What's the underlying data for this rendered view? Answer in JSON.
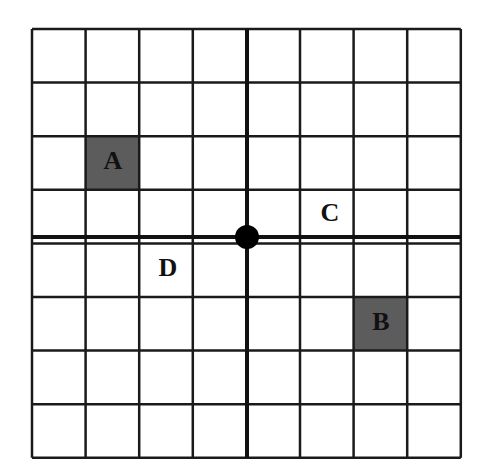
{
  "grid": {
    "rows": 8,
    "cols": 8,
    "left": 32,
    "top": 29,
    "cell": 53.6,
    "line_color": "#1a1a1a",
    "axis_color": "#111111",
    "background": "#ffffff"
  },
  "origin": {
    "x": 247,
    "y": 237,
    "radius": 12,
    "color": "#000000"
  },
  "shaded_cells": [
    {
      "label": "A",
      "col": 1,
      "row": 2,
      "fill": "#5c5c5c"
    },
    {
      "label": "B",
      "col": 6,
      "row": 5,
      "fill": "#5c5c5c"
    }
  ],
  "labels": [
    {
      "text": "A",
      "x": 113,
      "y": 169
    },
    {
      "text": "B",
      "x": 381,
      "y": 330
    },
    {
      "text": "C",
      "x": 330,
      "y": 221
    },
    {
      "text": "D",
      "x": 168,
      "y": 276
    }
  ]
}
